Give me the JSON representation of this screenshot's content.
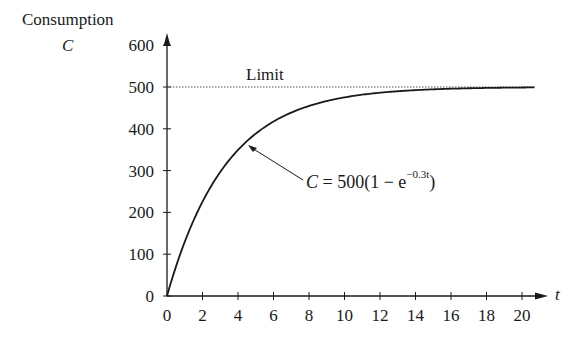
{
  "chart_data": {
    "type": "line",
    "title": "",
    "ylabel": "Consumption",
    "ylabel_symbol": "C",
    "xlabel": "t",
    "xlim": [
      0,
      21
    ],
    "ylim": [
      0,
      600
    ],
    "x_ticks": [
      0,
      2,
      4,
      6,
      8,
      10,
      12,
      14,
      16,
      18,
      20
    ],
    "y_ticks": [
      0,
      100,
      200,
      300,
      400,
      500,
      600
    ],
    "grid": false,
    "series": [
      {
        "name": "C = 500(1 − e^(−0.3t))",
        "x": [
          0,
          1,
          2,
          3,
          4,
          5,
          6,
          7,
          8,
          9,
          10,
          12,
          14,
          16,
          18,
          20,
          21
        ],
        "values": [
          0,
          129.6,
          225.6,
          296.6,
          349.4,
          388.4,
          417.4,
          438.8,
          454.6,
          466.4,
          475.1,
          486.3,
          492.5,
          495.9,
          497.7,
          498.8,
          499.1
        ]
      }
    ],
    "reference_lines": [
      {
        "name": "Limit",
        "y": 500,
        "style": "dotted"
      }
    ],
    "annotations": [
      {
        "text": "Limit",
        "position": "above limit line near x=5"
      },
      {
        "text": "C = 500(1 − e^(−0.3t))",
        "arrow_to": [
          4.5,
          370
        ]
      }
    ]
  },
  "labels": {
    "y_title": "Consumption",
    "y_symbol": "C",
    "x_symbol": "t",
    "limit": "Limit",
    "eq_c": "C",
    "eq_main": " = 500(1 − e",
    "eq_exp": "−0.3t",
    "eq_close": ")"
  }
}
